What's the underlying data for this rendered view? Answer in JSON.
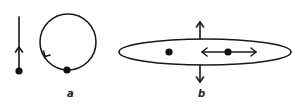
{
  "figure": {
    "panels": [
      {
        "id": "a",
        "label": "a",
        "elements": [
          "straight-line trajectory with upward arrow and point",
          "circular trajectory with counter-clockwise arrow and point"
        ]
      },
      {
        "id": "b",
        "label": "b",
        "elements": [
          "ellipse",
          "left point",
          "right point with double-headed horizontal arrow",
          "up arrow",
          "down arrow"
        ]
      }
    ],
    "colors": {
      "ink": "#1a1a1a",
      "background": "#ffffff"
    }
  }
}
